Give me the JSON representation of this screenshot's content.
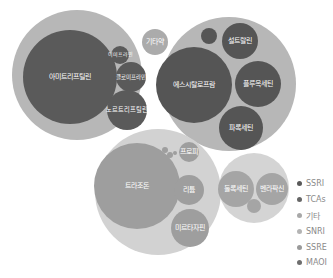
{
  "chart_data": {
    "type": "packed-bubble",
    "title": "",
    "legend_position": "right",
    "legend": [
      {
        "name": "SSRI",
        "color": "#595959"
      },
      {
        "name": "TCAs",
        "color": "#666666"
      },
      {
        "name": "기타",
        "color": "#a8a8a8"
      },
      {
        "name": "SNRI",
        "color": "#b4b4b4"
      },
      {
        "name": "SSRE",
        "color": "#9a9a9a"
      },
      {
        "name": "MAOI",
        "color": "#6e6e6e"
      }
    ],
    "groups": [
      {
        "name": "TCAs",
        "outer": {
          "cx": 77,
          "cy": 75,
          "r": 65,
          "color": "#b7b7b7"
        },
        "bubbles": [
          {
            "label": "아미트리프틸린",
            "cx": 70,
            "cy": 77,
            "r": 47,
            "color": "#5a5a5a"
          },
          {
            "label": "이미프라민",
            "cx": 120,
            "cy": 55,
            "r": 9,
            "color": "#5a5a5a"
          },
          {
            "label": "클로미프라민",
            "cx": 131,
            "cy": 77,
            "r": 15,
            "color": "#5a5a5a"
          },
          {
            "label": "노르트리프틸린",
            "cx": 127,
            "cy": 110,
            "r": 20,
            "color": "#5a5a5a"
          }
        ]
      },
      {
        "name": "SSRI",
        "outer": {
          "cx": 229,
          "cy": 84,
          "r": 67,
          "color": "#b7b7b7"
        },
        "bubbles": [
          {
            "label": "에스시탈로프람",
            "cx": 194,
            "cy": 85,
            "r": 38,
            "color": "#555555"
          },
          {
            "label": "설트랄린",
            "cx": 240,
            "cy": 41,
            "r": 18,
            "color": "#555555"
          },
          {
            "label": "플루옥세틴",
            "cx": 258,
            "cy": 84,
            "r": 23,
            "color": "#555555"
          },
          {
            "label": "파록세틴",
            "cx": 241,
            "cy": 128,
            "r": 22,
            "color": "#555555"
          },
          {
            "label": "",
            "cx": 209,
            "cy": 36,
            "r": 8,
            "color": "#555555"
          }
        ]
      },
      {
        "name": "기타",
        "outer": null,
        "bubbles": [
          {
            "label": "기타약",
            "cx": 155,
            "cy": 42,
            "r": 13,
            "color": "#ababab"
          }
        ]
      },
      {
        "name": "SNRI",
        "outer": {
          "cx": 158,
          "cy": 192,
          "r": 63,
          "color": "#d2d2d2"
        },
        "bubbles": [
          {
            "label": "트라조돈",
            "cx": 137,
            "cy": 186,
            "r": 43,
            "color": "#9e9e9e"
          },
          {
            "label": "프로피",
            "cx": 189,
            "cy": 152,
            "r": 10,
            "color": "#9e9e9e"
          },
          {
            "label": "리튬",
            "cx": 189,
            "cy": 190,
            "r": 15,
            "color": "#9e9e9e"
          },
          {
            "label": "미르타자핀",
            "cx": 190,
            "cy": 228,
            "r": 19,
            "color": "#9e9e9e"
          },
          {
            "label": "",
            "cx": 165,
            "cy": 150,
            "r": 3,
            "color": "#9e9e9e"
          },
          {
            "label": "",
            "cx": 170,
            "cy": 155,
            "r": 3,
            "color": "#9e9e9e"
          },
          {
            "label": "",
            "cx": 175,
            "cy": 153,
            "r": 2,
            "color": "#9e9e9e"
          }
        ]
      },
      {
        "name": "SSRE",
        "outer": {
          "cx": 254,
          "cy": 188,
          "r": 35,
          "color": "#d4d4d4"
        },
        "bubbles": [
          {
            "label": "둘록세틴",
            "cx": 236,
            "cy": 189,
            "r": 18,
            "color": "#a5a5a5"
          },
          {
            "label": "벤라팍신",
            "cx": 272,
            "cy": 189,
            "r": 16,
            "color": "#a5a5a5"
          },
          {
            "label": "",
            "cx": 254,
            "cy": 206,
            "r": 7,
            "color": "#a5a5a5"
          }
        ]
      }
    ]
  }
}
